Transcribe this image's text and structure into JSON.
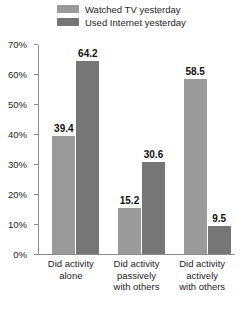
{
  "chart_data": {
    "type": "bar",
    "title": "",
    "subtitle": "",
    "xlabel": "",
    "ylabel": "",
    "ylim": [
      0,
      70
    ],
    "ytick_labels": [
      "0%",
      "10%",
      "20%",
      "30%",
      "40%",
      "50%",
      "60%",
      "70%"
    ],
    "ytick_values": [
      0,
      10,
      20,
      30,
      40,
      50,
      60,
      70
    ],
    "grid": false,
    "legend_position": "top",
    "categories": [
      "Did activity alone",
      "Did activity passively with others",
      "Did activity actively with others"
    ],
    "category_lines": [
      [
        "Did activity",
        "alone"
      ],
      [
        "Did activity",
        "passively",
        "with others"
      ],
      [
        "Did activity",
        "actively",
        "with others"
      ]
    ],
    "series": [
      {
        "name": "Watched TV yesterday",
        "color": "#9a9a9a",
        "values": [
          39.4,
          15.2,
          58.5
        ],
        "labels": [
          "39.4",
          "15.2",
          "58.5"
        ]
      },
      {
        "name": "Used Internet yesterday",
        "color": "#767676",
        "values": [
          64.2,
          30.6,
          9.5
        ],
        "labels": [
          "64.2",
          "30.6",
          "9.5"
        ]
      }
    ]
  },
  "colors": {
    "series_1": "#9a9a9a",
    "series_2": "#767676",
    "axis": "#8d8d8d",
    "text": "#1c1c1c",
    "value_text": "#111111",
    "background": "#ffffff"
  }
}
